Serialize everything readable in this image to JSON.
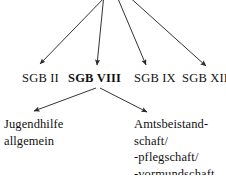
{
  "diagram": {
    "type": "hierarchy-tree",
    "colors": {
      "background": "#ffffff",
      "text": "#111111",
      "stroke": "#333333"
    },
    "level1": {
      "nodes": [
        {
          "label": "SGB II",
          "emphasis": "normal",
          "x": 22,
          "y": 71
        },
        {
          "label": "SGB VIII",
          "emphasis": "bold",
          "x": 68,
          "y": 71
        },
        {
          "label": "SGB IX",
          "emphasis": "normal",
          "x": 134,
          "y": 71
        },
        {
          "label": "SGB XII",
          "emphasis": "normal",
          "x": 182,
          "y": 71
        }
      ]
    },
    "level2": {
      "nodes": [
        {
          "name": "jugendhilfe-allgemein",
          "lines": [
            "Jugendhilfe",
            "allgemein"
          ],
          "x": 4,
          "y": 116
        },
        {
          "name": "amtsbeistandschaft",
          "lines": [
            "Amtsbeistand-",
            "schaft/",
            "-pflegschaft/",
            "-vormundschaft"
          ],
          "x": 134,
          "y": 116
        }
      ]
    },
    "edges": [
      {
        "name": "edge-to-sgb-ii",
        "from": [
          108,
          -6
        ],
        "to": [
          40,
          64
        ]
      },
      {
        "name": "edge-to-sgb-viii",
        "from": [
          104,
          -6
        ],
        "to": [
          97,
          65
        ]
      },
      {
        "name": "edge-to-sgb-ix",
        "from": [
          116,
          -6
        ],
        "to": [
          146,
          65
        ]
      },
      {
        "name": "edge-to-sgb-xii",
        "from": [
          126,
          -6
        ],
        "to": [
          206,
          66
        ]
      },
      {
        "name": "edge-to-jugendhilfe",
        "from": [
          96,
          88
        ],
        "to": [
          34,
          111
        ]
      },
      {
        "name": "edge-to-amtsbeistandschaft",
        "from": [
          100,
          88
        ],
        "to": [
          147,
          112
        ]
      }
    ]
  }
}
